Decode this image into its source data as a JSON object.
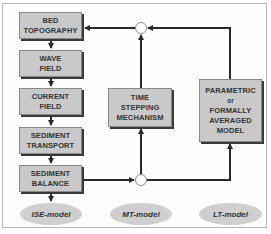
{
  "diagram": {
    "left_column": [
      {
        "line1": "BED",
        "line2": "TOPOGRAPHY"
      },
      {
        "line1": "WAVE",
        "line2": "FIELD"
      },
      {
        "line1": "CURRENT",
        "line2": "FIELD"
      },
      {
        "line1": "SEDIMENT",
        "line2": "TRANSPORT"
      },
      {
        "line1": "SEDIMENT",
        "line2": "BALANCE"
      }
    ],
    "middle_box": {
      "line1": "TIME",
      "line2": "STEPPING",
      "line3": "MECHANISM"
    },
    "right_box": {
      "line1": "PARAMETRIC",
      "line2": "or",
      "line3": "FORMALLY",
      "line4": "AVERAGED",
      "line5": "MODEL"
    },
    "labels": {
      "ise": "ISE-model",
      "mt": "MT-model",
      "lt": "LT-model"
    },
    "colors": {
      "box_fill": "#c9c9c9",
      "ellipse_fill": "#cfcfcf",
      "line": "#2a2a2a"
    }
  }
}
